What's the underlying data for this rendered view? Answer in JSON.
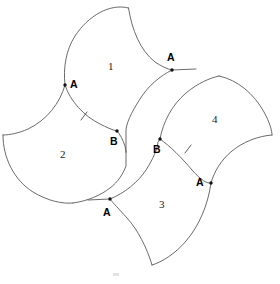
{
  "figure": {
    "background_color": "#ffffff",
    "stroke_color": "#5a5a5a",
    "label_color": "#000000",
    "width": 280,
    "height": 284
  },
  "regions": [
    {
      "id": "region-1",
      "label": "1",
      "x": 108,
      "y": 60
    },
    {
      "id": "region-2",
      "label": "2",
      "x": 60,
      "y": 148
    },
    {
      "id": "region-3",
      "label": "3",
      "x": 159,
      "y": 198
    },
    {
      "id": "region-4",
      "label": "4",
      "x": 212,
      "y": 113
    }
  ],
  "points": [
    {
      "id": "point-a-left",
      "label": "A",
      "dot_x": 65,
      "dot_y": 85,
      "label_x": 70,
      "label_y": 78
    },
    {
      "id": "point-a-top-right",
      "label": "A",
      "dot_x": 172,
      "dot_y": 70,
      "label_x": 167,
      "label_y": 51
    },
    {
      "id": "point-a-bottom-left",
      "label": "A",
      "dot_x": 110,
      "dot_y": 199,
      "label_x": 103,
      "label_y": 206
    },
    {
      "id": "point-a-right",
      "label": "A",
      "dot_x": 211,
      "dot_y": 183,
      "label_x": 196,
      "label_y": 176
    },
    {
      "id": "point-b-left",
      "label": "B",
      "dot_x": 117,
      "dot_y": 131,
      "label_x": 110,
      "label_y": 135
    },
    {
      "id": "point-b-right",
      "label": "B",
      "dot_x": 160,
      "dot_y": 139,
      "label_x": 153,
      "label_y": 143
    }
  ],
  "tick_marks": [
    {
      "id": "tick-left",
      "x": 84,
      "y": 116
    },
    {
      "id": "tick-right",
      "x": 188,
      "y": 149
    }
  ]
}
